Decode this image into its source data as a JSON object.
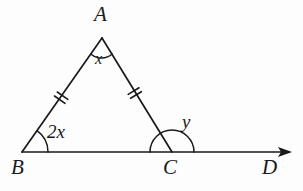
{
  "figure": {
    "type": "geometry-diagram",
    "background_color": "#fdfdfd",
    "ink_color": "#1a1a1a",
    "stroke_width": 1.6
  },
  "vertices": [
    {
      "id": "A",
      "label": "A",
      "x": 102,
      "y": 38,
      "label_x": 94,
      "label_y": 4
    },
    {
      "id": "B",
      "label": "B",
      "x": 22,
      "y": 152,
      "label_x": 11,
      "label_y": 157
    },
    {
      "id": "C",
      "label": "C",
      "x": 172,
      "y": 152,
      "label_x": 163,
      "label_y": 157
    },
    {
      "id": "D",
      "label": "D",
      "x": 288,
      "y": 152,
      "label_x": 262,
      "label_y": 157
    }
  ],
  "segments": [
    {
      "id": "AB",
      "from": "A",
      "to": "B",
      "ticks": 2
    },
    {
      "id": "AC",
      "from": "A",
      "to": "C",
      "ticks": 2
    },
    {
      "id": "BD",
      "from": "B",
      "to": "D",
      "ticks": 0,
      "arrow_end": true
    }
  ],
  "angles": [
    {
      "id": "angle-A",
      "vertex": "A",
      "label": "x",
      "label_x": 95,
      "label_y": 51,
      "arc_radius": 15,
      "arc_kind": "small-arc",
      "description": "apex angle at A"
    },
    {
      "id": "angle-B",
      "vertex": "B",
      "label": "2x",
      "label_x": 47,
      "label_y": 122,
      "arc_radius": 26,
      "arc_kind": "quarter-arc",
      "description": "interior base angle at B"
    },
    {
      "id": "angle-C",
      "vertex": "C",
      "label": "y",
      "label_x": 182,
      "label_y": 112,
      "arc_radius": 22,
      "arc_kind": "semicircle",
      "description": "exterior angle at C measured to ray CD"
    }
  ],
  "tick_marks": {
    "style": "double-hash",
    "count_per_side": 2,
    "length": 11,
    "spacing": 4,
    "meaning": "AB is congruent to AC"
  },
  "arrow": {
    "id": "ray-arrowhead",
    "tip_x": 292,
    "tip_y": 152,
    "length": 11,
    "half_width": 5
  }
}
